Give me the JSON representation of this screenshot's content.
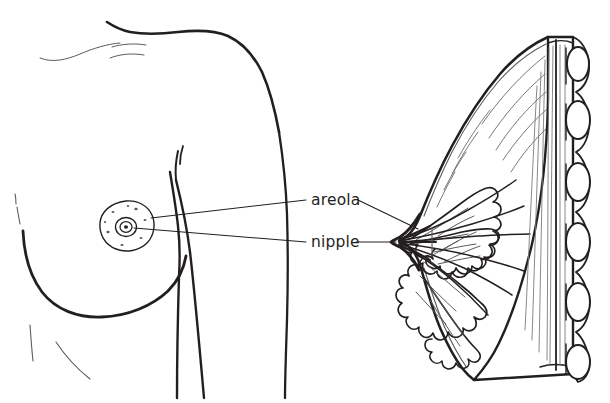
{
  "figure": {
    "background_color": "#ffffff",
    "ink_color": "#231f20",
    "fine_line_color": "#5b5b5b",
    "labels": [
      {
        "id": "areola",
        "text": "areola",
        "x": 311,
        "y": 205,
        "leader_left": "from left torso areola edge",
        "leader_right": "to cross-section areola region"
      },
      {
        "id": "nipple",
        "text": "nipple",
        "x": 311,
        "y": 246,
        "leader_left": "from left torso nipple center",
        "leader_right": "to cross-section nipple tip"
      }
    ],
    "panels": [
      {
        "id": "external-view",
        "name": "external side view of torso with breast",
        "parts": [
          "shoulder-and-neck-outline",
          "clavicle-sketch-lines",
          "arm-outline",
          "torso-side-outline",
          "breast-contour",
          "areola",
          "nipple",
          "montgomery-gland-dots",
          "rib-shading-lines"
        ]
      },
      {
        "id": "cross-section",
        "name": "sagittal cross-section of breast",
        "parts": [
          "breast-skin-outline",
          "nipple-tip",
          "lactiferous-ducts",
          "mammary-lobules",
          "suspensory-ligament-lines",
          "pectoral-muscle",
          "rib-chain"
        ],
        "rib_count": 7
      }
    ]
  }
}
